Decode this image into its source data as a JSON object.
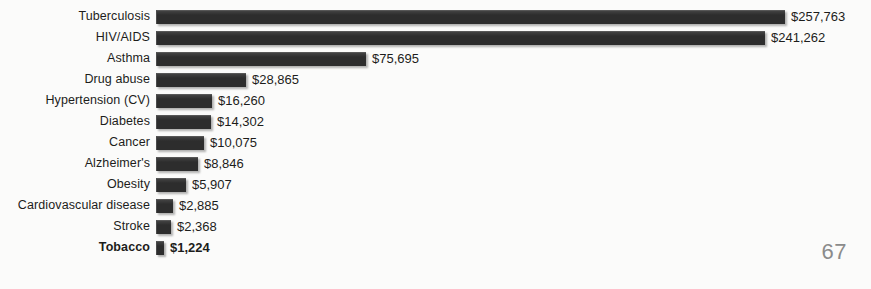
{
  "page": {
    "number": "67",
    "background_color": "#fbfbfa"
  },
  "chart_data": {
    "type": "bar",
    "orientation": "horizontal",
    "title": "",
    "subtitle": "",
    "xlabel": "",
    "ylabel": "",
    "grid": false,
    "legend": null,
    "value_prefix": "$",
    "bar_color": "#2d2d2d",
    "highlight_category": "Tobacco",
    "axis_note": "No numeric axis drawn; each bar is annotated with its value label.",
    "categories": [
      "Tuberculosis",
      "HIV/AIDS",
      "Asthma",
      "Drug abuse",
      "Hypertension (CV)",
      "Diabetes",
      "Cancer",
      "Alzheimer's",
      "Obesity",
      "Cardiovascular disease",
      "Stroke",
      "Tobacco"
    ],
    "values": [
      257763,
      241262,
      75695,
      28865,
      16260,
      14302,
      10075,
      8846,
      5907,
      2885,
      2368,
      1224
    ],
    "value_labels": [
      "$257,763",
      "$241,262",
      "$75,695",
      "$28,865",
      "$16,260",
      "$14,302",
      "$10,075",
      "$8,846",
      "$5,907",
      "$2,885",
      "$2,368",
      "$1,224"
    ],
    "bar_pixel_widths": [
      629,
      609,
      210,
      90,
      56,
      55,
      48,
      42,
      30,
      17,
      15,
      8
    ],
    "bold_rows": [
      "Tobacco"
    ]
  }
}
